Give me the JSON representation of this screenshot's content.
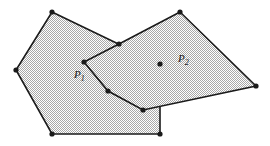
{
  "figure": {
    "type": "geometry-diagram",
    "background_color": "#ffffff",
    "fill_color": "#d9d9d9",
    "stroke_color": "#1a1a1a",
    "vertex_color": "#1a1a1a",
    "stroke_width": 1.6,
    "vertex_radius": 2.6,
    "width": 270,
    "height": 146
  },
  "shapes": [
    {
      "id": "P1",
      "name": "polygon-p1",
      "label": "P",
      "subscript": "1",
      "label_x": 74,
      "label_y": 78,
      "vertex_count": 5,
      "points": [
        [
          52,
          12
        ],
        [
          160,
          64
        ],
        [
          160,
          134
        ],
        [
          52,
          134
        ],
        [
          16,
          70
        ]
      ]
    },
    {
      "id": "P2",
      "name": "polygon-p2",
      "label": "P",
      "subscript": "2",
      "label_x": 178,
      "label_y": 62,
      "vertex_count": 6,
      "points": [
        [
          180,
          12
        ],
        [
          256,
          86
        ],
        [
          143,
          110
        ],
        [
          108,
          91
        ],
        [
          84,
          62
        ],
        [
          119,
          44
        ]
      ]
    }
  ],
  "labels": [
    {
      "id": "label-p1",
      "text": "P",
      "subscript": "1"
    },
    {
      "id": "label-p2",
      "text": "P",
      "subscript": "2"
    }
  ]
}
